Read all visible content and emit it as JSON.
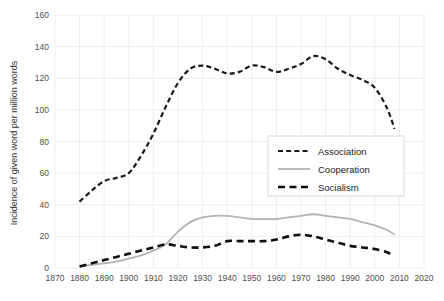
{
  "chart_data": {
    "type": "line",
    "title": "",
    "xlabel": "",
    "ylabel": "Incidence of given word per million words",
    "xlim": [
      1870,
      2020
    ],
    "ylim": [
      0,
      160
    ],
    "grid": true,
    "legend_position": "middle-right",
    "xticks": [
      1870,
      1880,
      1890,
      1900,
      1910,
      1920,
      1930,
      1940,
      1950,
      1960,
      1970,
      1980,
      1990,
      2000,
      2010,
      2020
    ],
    "yticks": [
      0,
      20,
      40,
      60,
      80,
      100,
      120,
      140,
      160
    ],
    "series": [
      {
        "name": "Association",
        "style": "dashed",
        "color": "#1a1a1a",
        "x": [
          1880,
          1885,
          1890,
          1895,
          1900,
          1905,
          1910,
          1915,
          1920,
          1925,
          1930,
          1935,
          1940,
          1945,
          1950,
          1955,
          1960,
          1965,
          1970,
          1975,
          1980,
          1985,
          1990,
          1995,
          2000,
          2005,
          2008
        ],
        "y": [
          42,
          49,
          55,
          57,
          60,
          71,
          85,
          102,
          117,
          126,
          128,
          126,
          123,
          124,
          128,
          127,
          124,
          126,
          129,
          134,
          132,
          126,
          122,
          119,
          114,
          101,
          88
        ]
      },
      {
        "name": "Cooperation",
        "style": "solid",
        "color": "#b3b3b3",
        "x": [
          1880,
          1885,
          1890,
          1895,
          1900,
          1905,
          1910,
          1915,
          1920,
          1925,
          1930,
          1935,
          1940,
          1945,
          1950,
          1955,
          1960,
          1965,
          1970,
          1975,
          1980,
          1985,
          1990,
          1995,
          2000,
          2005,
          2008
        ],
        "y": [
          1,
          2,
          3,
          4,
          6,
          8,
          11,
          15,
          23,
          29,
          32,
          33,
          33,
          32,
          31,
          31,
          31,
          32,
          33,
          34,
          33,
          32,
          31,
          29,
          27,
          24,
          21
        ]
      },
      {
        "name": "Socialism",
        "style": "dashed-long",
        "color": "#0d0d0d",
        "x": [
          1880,
          1885,
          1890,
          1895,
          1900,
          1905,
          1910,
          1915,
          1920,
          1925,
          1930,
          1935,
          1940,
          1945,
          1950,
          1955,
          1960,
          1965,
          1970,
          1975,
          1980,
          1985,
          1990,
          1995,
          2000,
          2005,
          2007
        ],
        "y": [
          1,
          3,
          5,
          7,
          9,
          11,
          13,
          15,
          14,
          13,
          13,
          14,
          17,
          17,
          17,
          17,
          18,
          20,
          21,
          20,
          18,
          16,
          14,
          13,
          12,
          10,
          8
        ]
      }
    ]
  },
  "legend": {
    "items": [
      {
        "label": "Association"
      },
      {
        "label": "Cooperation"
      },
      {
        "label": "Socialism"
      }
    ]
  },
  "axes": {
    "y_title": "Incidence of given word per million words"
  }
}
